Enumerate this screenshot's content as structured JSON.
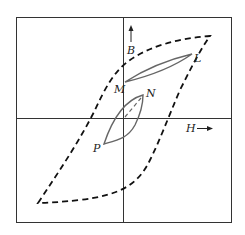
{
  "diagram": {
    "type": "hysteresis-loop",
    "labels": {
      "b_axis": "B",
      "h_axis": "H",
      "point_l": "L",
      "point_m": "M",
      "point_n": "N",
      "point_p": "P"
    },
    "colors": {
      "frame": "#333333",
      "major_loop": "#111111",
      "minor_loop": "#666666"
    }
  }
}
